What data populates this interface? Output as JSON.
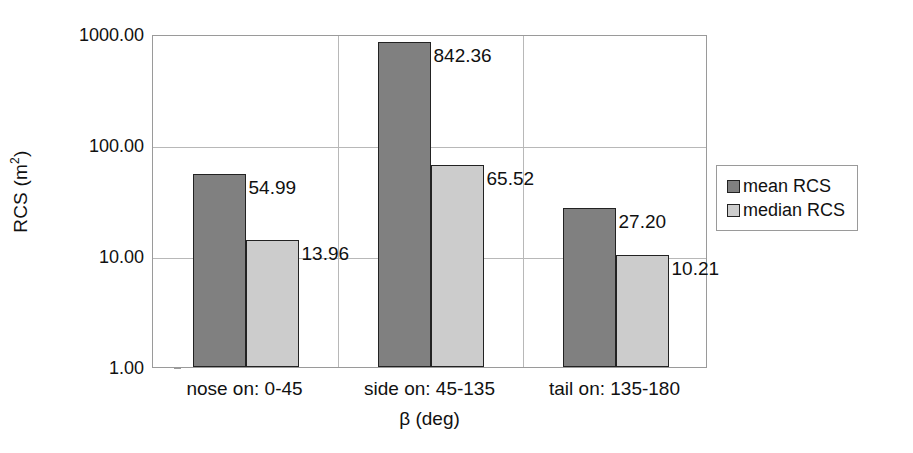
{
  "chart_data": {
    "type": "bar",
    "title": "",
    "xlabel": "β (deg)",
    "ylabel": "RCS (m2)",
    "ylabel_base": "RCS (m",
    "ylabel_sup": "2",
    "ylabel_tail": ")",
    "yscale": "log",
    "ylim": [
      1,
      1000
    ],
    "grid": true,
    "legend_position": "right",
    "categories": [
      "nose on:  0-45",
      "side on: 45-135",
      "tail on: 135-180"
    ],
    "ytick_labels": [
      "1000.00",
      "100.00",
      "10.00",
      "1.00"
    ],
    "ytick_values": [
      1000,
      100,
      10,
      1
    ],
    "series": [
      {
        "name": "mean RCS",
        "color": "#808080",
        "values": [
          54.99,
          842.36,
          27.2
        ],
        "labels": [
          "54.99",
          "842.36",
          "27.20"
        ]
      },
      {
        "name": "median RCS",
        "color": "#cccccc",
        "values": [
          13.96,
          65.52,
          10.21
        ],
        "labels": [
          "13.96",
          "65.52",
          "10.21"
        ]
      }
    ]
  },
  "legend": {
    "entries": [
      {
        "label": "mean RCS",
        "swatch": "mean"
      },
      {
        "label": "median RCS",
        "swatch": "median"
      }
    ]
  },
  "colors": {
    "mean_bar": "#808080",
    "median_bar": "#cccccc",
    "gridline": "#b8b8b8",
    "axis_line": "#9a9a9a",
    "text": "#111111",
    "background": "#ffffff"
  }
}
